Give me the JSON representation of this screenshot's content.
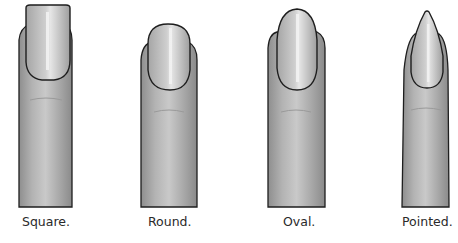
{
  "figure": {
    "items": [
      {
        "shape": "square",
        "label": "Square."
      },
      {
        "shape": "round",
        "label": "Round."
      },
      {
        "shape": "oval",
        "label": "Oval."
      },
      {
        "shape": "pointed",
        "label": "Pointed."
      }
    ]
  },
  "colors": {
    "skin": "#a9a9a9",
    "nail": "#c4c4c4",
    "outline": "#1e1e1e",
    "highlight": "#f2f2f2",
    "label": "#2a2a2a"
  }
}
